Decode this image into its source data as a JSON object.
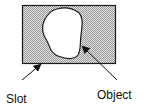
{
  "diagram": {
    "labels": {
      "slot": "Slot",
      "object": "Object"
    },
    "colors": {
      "slot_fill": "#c8c8c8",
      "outline": "#1a1a1a",
      "object_fill": "#ffffff"
    }
  }
}
